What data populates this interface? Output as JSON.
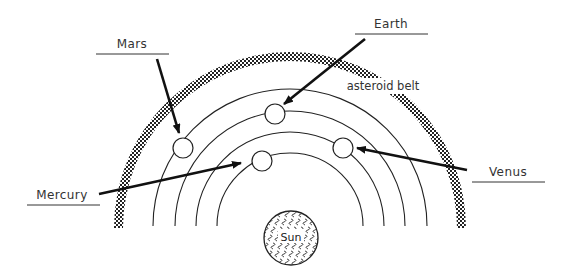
{
  "diagram": {
    "sun": {
      "label": "Sun",
      "cx": 291,
      "cy": 238,
      "r": 27
    },
    "center": {
      "cx": 290,
      "cy": 226
    },
    "orbits": [
      {
        "name": "mercury-orbit",
        "r": 73
      },
      {
        "name": "venus-orbit",
        "r": 94
      },
      {
        "name": "earth-orbit",
        "r": 115
      },
      {
        "name": "mars-orbit",
        "r": 137
      }
    ],
    "asteroid_belt": {
      "label": "asteroid belt",
      "r": 171
    },
    "planets": [
      {
        "name": "Mercury",
        "cx": 262,
        "cy": 161,
        "r": 10
      },
      {
        "name": "Venus",
        "cx": 343,
        "cy": 148,
        "r": 10
      },
      {
        "name": "Earth",
        "cx": 275,
        "cy": 114,
        "r": 10
      },
      {
        "name": "Mars",
        "cx": 183,
        "cy": 148,
        "r": 10
      }
    ],
    "labels": [
      {
        "text": "Mars",
        "tx": 132,
        "ty": 48,
        "ux1": 96,
        "ux2": 169,
        "uy": 54,
        "ax1": 157,
        "ay1": 59,
        "ax2": 179,
        "ay2": 133
      },
      {
        "text": "Earth",
        "tx": 391,
        "ty": 28,
        "ux1": 355,
        "ux2": 428,
        "uy": 34,
        "ax1": 365,
        "ay1": 39,
        "ax2": 284,
        "ay2": 104
      },
      {
        "text": "Venus",
        "tx": 508,
        "ty": 176,
        "ux1": 472,
        "ux2": 545,
        "uy": 182,
        "ax1": 467,
        "ay1": 170,
        "ax2": 357,
        "ay2": 148
      },
      {
        "text": "Mercury",
        "tx": 62,
        "ty": 199,
        "ux1": 27,
        "ux2": 100,
        "uy": 205,
        "ax1": 99,
        "ay1": 194,
        "ax2": 241,
        "ay2": 163
      }
    ],
    "colors": {
      "line": "#222222",
      "text": "#333333",
      "background": "#ffffff"
    }
  }
}
